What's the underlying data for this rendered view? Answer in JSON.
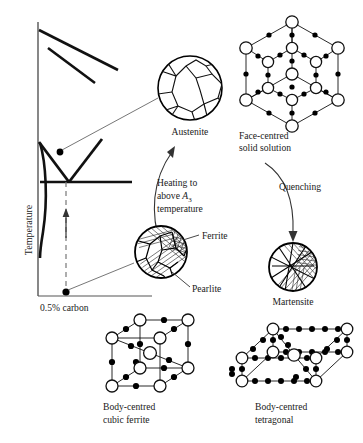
{
  "figure": {
    "kind": "steel-heat-treatment-diagram",
    "colors": {
      "ink": "#000000",
      "text": "#1a1a1a",
      "thin_line": "#555555",
      "background": "#ffffff",
      "atom_fill_large": "#ffffff",
      "atom_fill_small": "#000000"
    }
  },
  "phase_diagram": {
    "y_axis_label": "Temperature",
    "composition_label": "0.5% carbon"
  },
  "micrographs": [
    {
      "id": "austenite",
      "label": "Austenite",
      "type": "grain-structure"
    },
    {
      "id": "ferrite-pearlite",
      "label_ferrite": "Ferrite",
      "label_pearlite": "Pearlite",
      "type": "hatched-grain-structure"
    },
    {
      "id": "martensite",
      "label": "Martensite",
      "type": "needle-structure"
    }
  ],
  "lattices": [
    {
      "id": "fcc",
      "label_line1": "Face-centred",
      "label_line2": "solid solution",
      "type": "face-centred-cubic"
    },
    {
      "id": "bcc",
      "label_line1": "Body-centred",
      "label_line2": "cubic ferrite",
      "type": "body-centred-cubic"
    },
    {
      "id": "bct",
      "label_line1": "Body-centred",
      "label_line2": "tetragonal",
      "type": "body-centred-tetragonal"
    }
  ],
  "process_arrows": [
    {
      "id": "heating",
      "line1": "Heating to",
      "line2_prefix": "above ",
      "line2_symbol": "A",
      "line2_subscript": "3",
      "line3": "temperature"
    },
    {
      "id": "quenching",
      "line1": "Quenching"
    }
  ]
}
